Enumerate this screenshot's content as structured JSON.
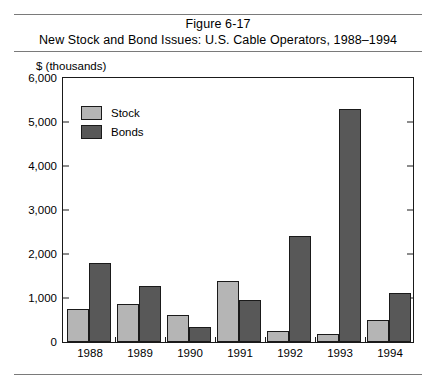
{
  "figure": {
    "title_line1": "Figure 6-17",
    "title_line2": "New Stock and Bond Issues: U.S. Cable Operators, 1988–1994"
  },
  "chart_data": {
    "type": "bar",
    "title": "New Stock and Bond Issues: U.S. Cable Operators, 1988–1994",
    "xlabel": "",
    "ylabel": "$ (thousands)",
    "ylim": [
      0,
      6000
    ],
    "ytick_labels": [
      "6,000",
      "5,000",
      "4,000",
      "3,000",
      "2,000",
      "1,000",
      "0"
    ],
    "ytick_values": [
      6000,
      5000,
      4000,
      3000,
      2000,
      1000,
      0
    ],
    "grid": false,
    "legend_position": "upper-left-inside",
    "categories": [
      "1988",
      "1989",
      "1990",
      "1991",
      "1992",
      "1993",
      "1994"
    ],
    "series": [
      {
        "name": "Stock",
        "color": "#b5b5b5",
        "values": [
          750,
          870,
          620,
          1380,
          250,
          180,
          500
        ]
      },
      {
        "name": "Bonds",
        "color": "#585858",
        "values": [
          1800,
          1270,
          330,
          950,
          2400,
          5300,
          1110
        ]
      }
    ]
  },
  "colors": {
    "stock": "#b5b5b5",
    "bonds": "#585858",
    "axis": "#1a1a1a",
    "rule": "#7a7a7a"
  }
}
